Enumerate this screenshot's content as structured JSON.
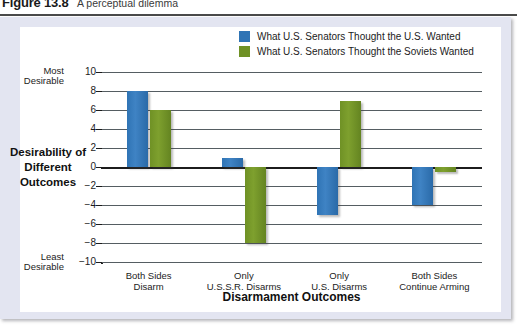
{
  "caption": {
    "figure_number": "Figure 13.8",
    "text": "A perceptual dilemma"
  },
  "chart_data": {
    "type": "bar",
    "title": "A perceptual dilemma",
    "xlabel": "Disarmament Outcomes",
    "ylabel": "Desirability of Different Outcomes",
    "categories": [
      "Both Sides\nDisarm",
      "Only\nU.S.S.R. Disarms",
      "Only\nU.S. Disarms",
      "Both Sides\nContinue Arming"
    ],
    "category_lines": [
      [
        "Both Sides",
        "Disarm"
      ],
      [
        "Only",
        "U.S.S.R. Disarms"
      ],
      [
        "Only",
        "U.S. Disarms"
      ],
      [
        "Both Sides",
        "Continue Arming"
      ]
    ],
    "series": [
      {
        "name": "What U.S. Senators Thought the U.S. Wanted",
        "color": "#2f74b5",
        "values": [
          8,
          1,
          -5,
          -4
        ]
      },
      {
        "name": "What U.S. Senators Thought the Soviets Wanted",
        "color": "#6f9125",
        "values": [
          6,
          -8,
          7,
          -0.5
        ]
      }
    ],
    "ylim": [
      -10,
      10
    ],
    "yticks": [
      10,
      8,
      6,
      4,
      2,
      0,
      -2,
      -4,
      -6,
      -8,
      -10
    ],
    "ytick_labels": [
      "10",
      "8",
      "6",
      "4",
      "2",
      "0",
      "−2",
      "−4",
      "−6",
      "−8",
      "−10"
    ],
    "axis_extreme_labels": {
      "top_line1": "Most",
      "top_line2": "Desirable",
      "bottom_line1": "Least",
      "bottom_line2": "Desirable"
    },
    "ylabel_lines": [
      "Desirability of",
      "Different",
      "Outcomes"
    ],
    "grid": true,
    "legend_position": "top-right"
  },
  "colors": {
    "series_blue": "#2f74b5",
    "series_green": "#6f9125",
    "panel_background": "#e3e5f1",
    "plot_background": "#ffffff",
    "gridline": "#555d62",
    "axis": "#1c1c1c"
  }
}
